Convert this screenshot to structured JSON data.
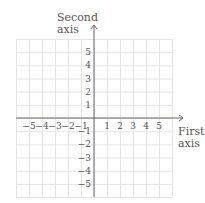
{
  "diagram": {
    "type": "cartesian-coordinate-grid",
    "y_axis_label_line1": "Second",
    "y_axis_label_line2": "axis",
    "x_axis_label_line1": "First",
    "x_axis_label_line2": "axis",
    "x_ticks": [
      "−5",
      "−4",
      "−3",
      "−2",
      "−1",
      "1",
      "2",
      "3",
      "4",
      "5"
    ],
    "y_ticks": [
      "5",
      "4",
      "3",
      "2",
      "1",
      "−1",
      "−2",
      "−3",
      "−4",
      "−5"
    ],
    "grid_range": [
      -6,
      6
    ],
    "colors": {
      "grid": "#e4e4e4",
      "axis": "#666666",
      "text": "#555555"
    }
  }
}
